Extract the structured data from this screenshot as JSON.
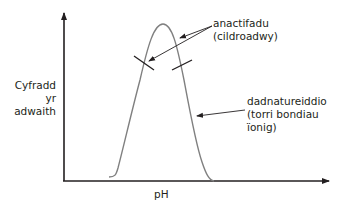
{
  "diagram": {
    "type": "enzyme-activity-vs-pH",
    "y_axis": {
      "label_lines": [
        "Cyfradd",
        "yr",
        "adwaith"
      ]
    },
    "x_axis": {
      "label": "pH"
    },
    "annotations": [
      {
        "id": "inactivation",
        "lines": [
          "anactifadu",
          "(cildroadwy)"
        ]
      },
      {
        "id": "denaturation",
        "lines": [
          "dadnatureiddio",
          "(torri bondiau",
          "ïonig)"
        ]
      }
    ],
    "colors": {
      "axis": "#231f20",
      "curve": "#808080",
      "text": "#231f20"
    }
  }
}
